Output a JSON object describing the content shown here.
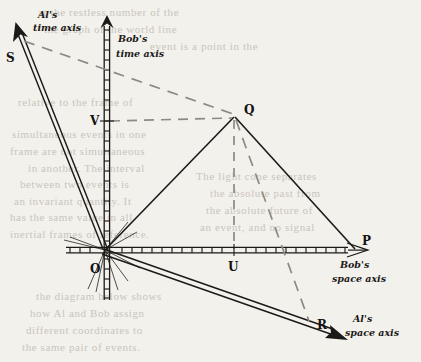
{
  "figure": {
    "background_color": "#f3f1ec",
    "ink_color": "#1c1a18",
    "dash_color": "#8e8a83"
  },
  "axis_labels": {
    "al_time_line1": "Al's",
    "al_time_line2": "time axis",
    "bob_time_line1": "Bob's",
    "bob_time_line2": "time axis",
    "bob_space_line1": "Bob's",
    "bob_space_line2": "space axis",
    "al_space_line1": "Al's",
    "al_space_line2": "space axis"
  },
  "points": [
    {
      "name": "S",
      "label": "S",
      "x": 20,
      "y": 40,
      "label_x": 6,
      "label_y": 62
    },
    {
      "name": "V",
      "label": "V",
      "x": 107,
      "y": 121,
      "label_x": 90,
      "label_y": 125
    },
    {
      "name": "Q",
      "label": "Q",
      "x": 235,
      "y": 116,
      "label_x": 244,
      "label_y": 114
    },
    {
      "name": "O",
      "label": "O",
      "x": 105,
      "y": 250,
      "label_x": 90,
      "label_y": 273
    },
    {
      "name": "U",
      "label": "U",
      "x": 234,
      "y": 250,
      "label_x": 228,
      "label_y": 271
    },
    {
      "name": "P",
      "label": "P",
      "x": 355,
      "y": 250,
      "label_x": 362,
      "label_y": 245
    },
    {
      "name": "R",
      "label": "R",
      "x": 310,
      "y": 322,
      "label_x": 317,
      "label_y": 329
    }
  ],
  "ghost_text": [
    {
      "text": "at the restless number of the",
      "x": 38,
      "y": 6
    },
    {
      "text": "the graph of the world line",
      "x": 44,
      "y": 23
    },
    {
      "text": "event is a point in the",
      "x": 150,
      "y": 40
    },
    {
      "text": "relative to the frame of",
      "x": 18,
      "y": 96
    },
    {
      "text": "simultaneous events in one",
      "x": 12,
      "y": 128
    },
    {
      "text": "frame are not simultaneous",
      "x": 10,
      "y": 145
    },
    {
      "text": "in another. The interval",
      "x": 28,
      "y": 162
    },
    {
      "text": "between two events is",
      "x": 20,
      "y": 178
    },
    {
      "text": "an invariant quantity. It",
      "x": 14,
      "y": 195
    },
    {
      "text": "has the same value in all",
      "x": 10,
      "y": 211
    },
    {
      "text": "inertial frames of reference.",
      "x": 10,
      "y": 228
    },
    {
      "text": "The light cone separates",
      "x": 196,
      "y": 170
    },
    {
      "text": "the absolute past from",
      "x": 210,
      "y": 187
    },
    {
      "text": "the absolute future of",
      "x": 206,
      "y": 204
    },
    {
      "text": "an event, and no signal",
      "x": 200,
      "y": 221
    },
    {
      "text": "the diagram below shows",
      "x": 36,
      "y": 290
    },
    {
      "text": "how Al and Bob assign",
      "x": 30,
      "y": 307
    },
    {
      "text": "different coordinates to",
      "x": 26,
      "y": 324
    },
    {
      "text": "the same pair of events.",
      "x": 22,
      "y": 341
    }
  ]
}
